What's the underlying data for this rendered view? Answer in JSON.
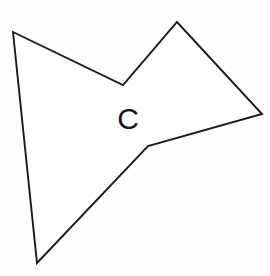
{
  "figure": {
    "name": "labeled-polygon-figure",
    "background_color": "#fdfdfd",
    "fill_color": "#ffffff",
    "stroke_color": "#1b1b1b",
    "stroke_width": 1.9,
    "width": 270,
    "height": 276,
    "label": {
      "text": "C",
      "x": 128,
      "y": 129,
      "font_size": 30,
      "color": "#151515"
    },
    "polygon": {
      "shape_name": "irregular-concave-hexagon",
      "vertex_count": 6,
      "points_attr": "13,32 123,85 177,22 262,114 148,146 37,263",
      "vertices": [
        {
          "id": "v1",
          "name": "top-left-vertex",
          "x": 13,
          "y": 32
        },
        {
          "id": "v2",
          "name": "upper-notch-vertex",
          "x": 123,
          "y": 85
        },
        {
          "id": "v3",
          "name": "top-peak-vertex",
          "x": 177,
          "y": 22
        },
        {
          "id": "v4",
          "name": "right-vertex",
          "x": 262,
          "y": 114
        },
        {
          "id": "v5",
          "name": "lower-bend-vertex",
          "x": 148,
          "y": 146
        },
        {
          "id": "v6",
          "name": "bottom-vertex",
          "x": 37,
          "y": 263
        }
      ]
    }
  }
}
